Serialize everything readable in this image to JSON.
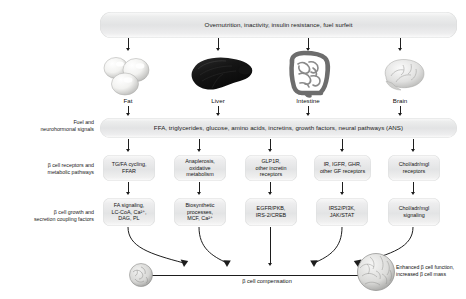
{
  "figure": {
    "title_banner": "Overnutrition, inactivity, insulin resistance, fuel surfeit",
    "signals_banner": "FFA, triglycerides, glucose, amino acids, incretins, growth factors, neural pathways (ANS)"
  },
  "row_labels": [
    {
      "id": "fuel-signals",
      "line1": "Fuel and",
      "line2": "neurohormonal signals"
    },
    {
      "id": "receptors-pathways",
      "line1": "β cell receptors and",
      "line2": "metabolic pathways"
    },
    {
      "id": "growth-coupling",
      "line1": "β cell growth and",
      "line2": "secretion coupling factors"
    }
  ],
  "organs": [
    {
      "id": "fat",
      "label": "Fat",
      "icon": "adipocyte-icon"
    },
    {
      "id": "liver",
      "label": "Liver",
      "icon": "liver-icon"
    },
    {
      "id": "intestine",
      "label": "Intestine",
      "icon": "intestine-icon"
    },
    {
      "id": "brain",
      "label": "Brain",
      "icon": "brain-icon"
    }
  ],
  "receptor_boxes": [
    {
      "id": "tgfa",
      "lines": [
        "TG/FA cycling,",
        "FFAR"
      ]
    },
    {
      "id": "anaplerosis",
      "lines": [
        "Anaplerosis,",
        "oxidative",
        "metabolism"
      ]
    },
    {
      "id": "glp1r",
      "lines": [
        "GLP1R,",
        "other incretin",
        "receptors"
      ]
    },
    {
      "id": "gf-rec",
      "lines": [
        "IR, IGFR, GHR,",
        "other GF receptors"
      ]
    },
    {
      "id": "chol-rec",
      "lines": [
        "Chol/adr/mgl",
        "receptors"
      ]
    }
  ],
  "coupling_boxes": [
    {
      "id": "fa-signaling",
      "lines": [
        "FA signaling,",
        "LC-CoA, Ca²⁺,",
        "DAG, PL"
      ]
    },
    {
      "id": "biosynthetic",
      "lines": [
        "Biosynthetic",
        "processes,",
        "MCF, Ca²⁺"
      ]
    },
    {
      "id": "egfr-pkb",
      "lines": [
        "EGFR/PKB,",
        "IRS-2/CREB"
      ]
    },
    {
      "id": "irs2-pi3k",
      "lines": [
        "IRS2/PI3K,",
        "JAK/STAT"
      ]
    },
    {
      "id": "chol-sig",
      "lines": [
        "Chol/adr/mgl",
        "signaling"
      ]
    }
  ],
  "outcome": {
    "axis_label": "β cell compensation",
    "result_line1": "Enhanced β cell function,",
    "result_line2": "increased β cell mass",
    "islet_start_name": "small-islet-icon",
    "islet_end_name": "large-islet-icon"
  },
  "colors": {
    "text": "#111111",
    "arrow": "#1d1d1d",
    "banner_fill": "#e8e9ea",
    "box_fill": "#e6e7e8"
  }
}
